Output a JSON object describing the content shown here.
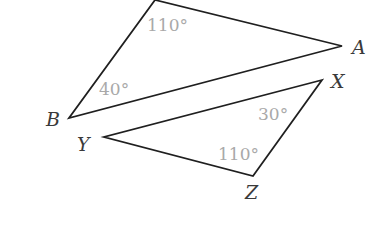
{
  "diagram": {
    "title": "",
    "colors": {
      "edges": "#1f1f1f",
      "vertex_labels": "#3a3a3a",
      "angle_labels": "#a9a9a9",
      "background": "#ffffff"
    },
    "triangles": [
      {
        "name": "triangle-ABC",
        "vertices": [
          {
            "id": "top",
            "label": "",
            "x": 155,
            "y": 0
          },
          {
            "id": "A",
            "label": "A",
            "x": 342,
            "y": 46,
            "label_x": 352,
            "label_y": 54
          },
          {
            "id": "B",
            "label": "B",
            "x": 69,
            "y": 118,
            "label_x": 46,
            "label_y": 126
          }
        ],
        "angles": [
          {
            "at": "top",
            "label": "110°",
            "x": 147,
            "y": 31
          },
          {
            "at": "B",
            "label": "40°",
            "x": 99,
            "y": 95
          }
        ]
      },
      {
        "name": "triangle-XYZ",
        "vertices": [
          {
            "id": "X",
            "label": "X",
            "x": 322,
            "y": 80,
            "label_x": 331,
            "label_y": 88
          },
          {
            "id": "Y",
            "label": "Y",
            "x": 104,
            "y": 137,
            "label_x": 77,
            "label_y": 151
          },
          {
            "id": "Z",
            "label": "Z",
            "x": 253,
            "y": 176,
            "label_x": 245,
            "label_y": 199
          }
        ],
        "angles": [
          {
            "at": "X",
            "label": "30°",
            "x": 258,
            "y": 120
          },
          {
            "at": "Z",
            "label": "110°",
            "x": 218,
            "y": 160
          }
        ]
      }
    ]
  }
}
